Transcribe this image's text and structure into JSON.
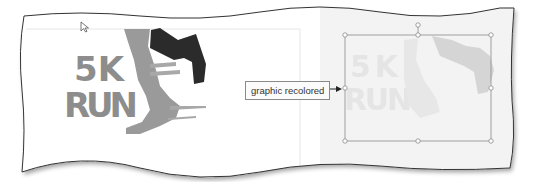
{
  "callout": {
    "label": "graphic recolored"
  },
  "left_slide": {
    "logo": {
      "line1": "5K",
      "line2": "RUN"
    },
    "colors": {
      "text": "#8d8d8d",
      "leg": "#9a9a9a",
      "shoe": "#2b2b2b"
    }
  },
  "right_slide": {
    "logo": {
      "line1": "5K",
      "line2": "RUN"
    },
    "colors": {
      "recolored": "#d9d9d9",
      "shoe": "#cfcfcf",
      "background": "#f3f3f3"
    }
  },
  "icons": {
    "cursor": "mouse-pointer-icon",
    "arrow": "arrow-right-icon"
  }
}
